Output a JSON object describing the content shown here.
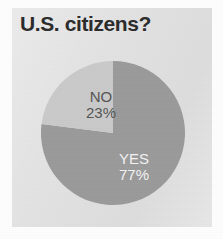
{
  "figure": {
    "title": "U.S. citizens?",
    "panel_color": "#e2e2e2",
    "page_color": "#fdfdfd",
    "title_color": "#2b2b2b"
  },
  "chart_data": {
    "type": "pie",
    "title": "U.S. citizens?",
    "xlabel": "",
    "ylabel": "",
    "legend": "none",
    "grid": false,
    "start_angle_deg": 90,
    "direction": "clockwise",
    "categories": [
      "YES",
      "NO"
    ],
    "values": [
      77,
      23
    ],
    "units": "percent",
    "slices": [
      {
        "label": "YES",
        "value": 77,
        "value_label": "77%",
        "color": "#9a9a9a",
        "text_color": "#f2f2f2"
      },
      {
        "label": "NO",
        "value": 23,
        "value_label": "23%",
        "color": "#c9c9c9",
        "text_color": "#555555"
      }
    ]
  }
}
